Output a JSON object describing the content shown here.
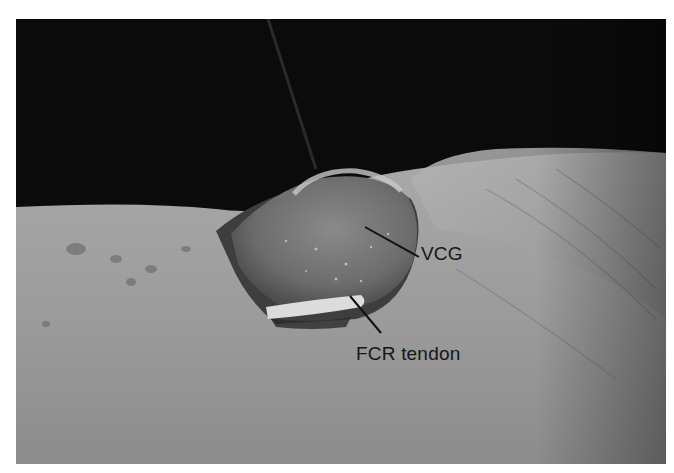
{
  "figure": {
    "type": "clinical-photograph",
    "grayscale": true,
    "annotations": [
      {
        "id": "vcg",
        "text": "VCG"
      },
      {
        "id": "fcr",
        "text": "FCR tendon"
      }
    ],
    "colors": {
      "background": "#0b0b0b",
      "skin": "#9a9a9a",
      "graft": "#6e6e6e",
      "tendon": "#dcdcdc",
      "leader_line": "#111111",
      "label_text": "#161616"
    }
  }
}
